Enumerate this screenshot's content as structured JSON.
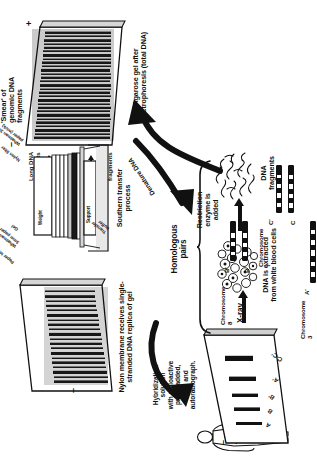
{
  "figure": {
    "orientation": "rotated-90-ccw",
    "background_color": "#ffffff",
    "ink_color": "#111111"
  },
  "steps": {
    "blood_sample": "Blood sample",
    "dna_extracted": "DNA is extracted\nfrom white blood cells",
    "restriction_enzyme": "Restriction\nenzyme is\nadded",
    "dna_fragments": "DNA\nfragments",
    "long_dna_fragments": "Long DNA\nfragments",
    "short_dna_fragments": "Short DNA\nfragments",
    "smear": "'Smear' of\ngenomic DNA\nfragments",
    "agarose_gel": "Agarose gel after\nelectrophoresis (total DNA)",
    "denature_dna": "Denature DNA",
    "southern_transfer": "Southern transfer\nprocess",
    "nylon_membrane": "Nylon membrane receives single-\nstranded DNA replica of gel",
    "hybridization": "Hybridization\nsolution\nwith radioactive\nprobe added,\nwash and\nautoradiograph.",
    "xray": "X-ray",
    "homologous_pairs": "Homologous\npairs"
  },
  "transfer_stack": {
    "weight": "Weight",
    "paper_towel": "Paper towel",
    "whatman_top": "Whatman\n3mm paper",
    "gel": "Gel",
    "nylon_filter": "Nylon filter",
    "whatman_wick": "Whatman 3mm\npaper (wick)",
    "transfer_buffer": "Transfer\nbuffer",
    "support": "Support"
  },
  "electrophoresis": {
    "negative": "–",
    "positive": "+"
  },
  "chromosomes": [
    {
      "name": "Chromosome\n3",
      "alleles": [
        "A",
        "A'"
      ]
    },
    {
      "name": "Chromosome\n7",
      "alleles": [
        "C",
        "C'"
      ]
    },
    {
      "name": "Chromosome\n8",
      "alleles": [
        "B",
        "B'"
      ]
    }
  ],
  "xray_bands": {
    "negative": "–",
    "labels": [
      "A",
      "B",
      "B'",
      "A'",
      "C-C'"
    ]
  }
}
